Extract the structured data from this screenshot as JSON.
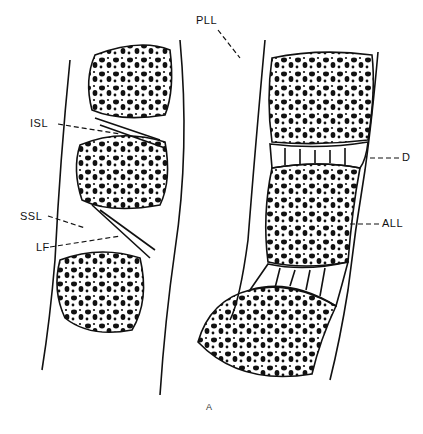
{
  "figure": {
    "caption": "A",
    "labels": {
      "pll": "PLL",
      "isl": "ISL",
      "ssl": "SSL",
      "lf": "LF",
      "d": "D",
      "all": "ALL"
    },
    "colors": {
      "line": "#111111",
      "background": "#ffffff"
    }
  }
}
